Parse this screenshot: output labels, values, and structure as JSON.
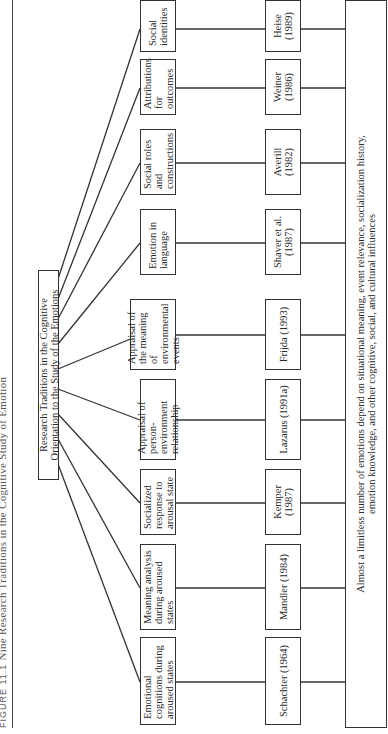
{
  "figure": {
    "caption_label": "FIGURE 11.1",
    "caption_title": "Nine Research Traditions in the Cognitive Study of Emotion",
    "orientation": "rotated 90 degrees counter-clockwise",
    "root": {
      "label": "Research Traditions in the Cognitive Orientation to the Study of the Emotions"
    },
    "traditions": [
      {
        "label": "Emotional cognitions during aroused states",
        "citation": "Schachter (1964)"
      },
      {
        "label": "Meaning analysis during aroused states",
        "citation": "Mandler (1984)"
      },
      {
        "label": "Socialized response to arousal state",
        "citation": "Kemper (1987)"
      },
      {
        "label": "Appraisal of person-environment relationship",
        "citation": "Lazarus (1991a)"
      },
      {
        "label": "Appraisal of the meaning of environmental events",
        "citation": "Frijda (1993)"
      },
      {
        "label": "Emotion in language",
        "citation": "Shaver et al. (1987)"
      },
      {
        "label": "Social roles and constructions",
        "citation": "Averill (1982)"
      },
      {
        "label": "Attributions for outcomes",
        "citation": "Weiner (1986)"
      },
      {
        "label": "Social identities",
        "citation": "Heise (1989)"
      }
    ],
    "conclusion": {
      "label": "Almost a limitless number of emotions depend on situational meaning, event relevance, socialization history, emotion knowledge, and other cognitive, social, and cultural influences"
    }
  }
}
